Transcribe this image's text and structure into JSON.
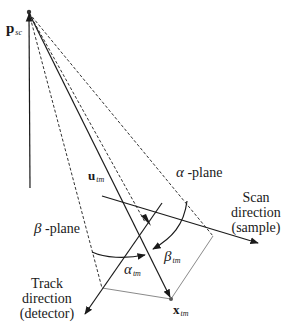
{
  "diagram": {
    "labels": {
      "p_sc": {
        "symbol": "p",
        "subscript": "sc"
      },
      "u_tm": {
        "symbol": "u",
        "subscript": "tm"
      },
      "x_tm": {
        "symbol": "x",
        "subscript": "tm"
      },
      "alpha_tm": {
        "symbol": "α",
        "subscript": "tm"
      },
      "beta_tm": {
        "symbol": "β",
        "subscript": "tm"
      },
      "alpha_plane": {
        "symbol": "α",
        "text": " -plane"
      },
      "beta_plane": {
        "symbol": "β",
        "text": " -plane"
      },
      "scan_direction": {
        "line1": "Scan",
        "line2": "direction",
        "line3": "(sample)"
      },
      "track_direction": {
        "line1": "Track",
        "line2": "direction",
        "line3": "(detector)"
      }
    },
    "colors": {
      "line": "#1a1a1a",
      "dashed": "#333333",
      "parallelogram": "#888888",
      "background": "#ffffff"
    }
  }
}
